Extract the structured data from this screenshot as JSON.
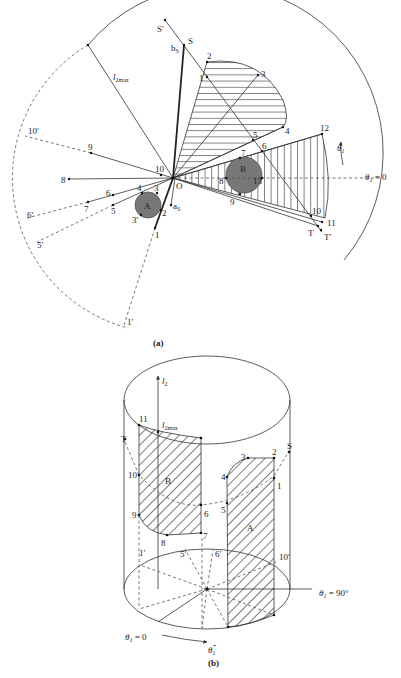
{
  "figure_a": {
    "caption": "(a)",
    "origin_label": "O",
    "radius_label_main": "l",
    "radius_label_sub": "2max",
    "angle_label": "θ",
    "angle_sub": "1",
    "angle_zero": " = 0",
    "angle_plus_label": "θ",
    "angle_plus_sub": "1",
    "angle_plus_sup": "+",
    "start": {
      "label": "S",
      "prime_label": "S′",
      "b_label": "b",
      "b_sub": "S"
    },
    "goal": {
      "label": "T",
      "prime_label": "T′"
    },
    "a_label": "a",
    "a_sub": "S",
    "obstacle_a": {
      "label": "A",
      "points": [
        "1",
        "2",
        "3",
        "3′",
        "4",
        "5",
        "6",
        "7"
      ],
      "projected": [
        "1′",
        "5′",
        "6′"
      ]
    },
    "obstacle_b": {
      "label": "B",
      "points": [
        "7",
        "8",
        "9",
        "10",
        "11",
        "12",
        "13"
      ],
      "projected": [
        "10′"
      ]
    },
    "region_points": [
      "1",
      "2",
      "3",
      "4",
      "5",
      "6"
    ],
    "left_points": [
      "8",
      "9",
      "10"
    ]
  },
  "figure_b": {
    "caption": "(b)",
    "axis_label": "l",
    "axis_sub": "2",
    "l2max_label": "l",
    "l2max_sub": "2max",
    "theta_zero": "θ",
    "theta_zero_sub": "1",
    "theta_zero_val": " = 0",
    "theta_90": "θ",
    "theta_90_sub": "1",
    "theta_90_val": " = 90°",
    "theta_plus": "θ",
    "theta_plus_sub": "1",
    "theta_plus_sup": "+",
    "start_label": "S",
    "goal_label": "T",
    "region_a_label": "A",
    "region_b_label": "B",
    "region_a_points": [
      "1",
      "2",
      "3",
      "4",
      "5"
    ],
    "region_b_points": [
      "6",
      "7",
      "8",
      "9",
      "10",
      "11"
    ],
    "base_points": [
      "1′",
      "5′",
      "6′",
      "10′"
    ]
  }
}
